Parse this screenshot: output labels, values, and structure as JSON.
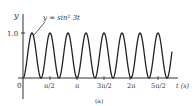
{
  "chart_data": {
    "type": "line",
    "title": "",
    "function_label": "y = sin² 3t",
    "xlabel": "t (s)",
    "ylabel": "y",
    "caption": "(a)",
    "x_ticks": [
      "0",
      "π/2",
      "π",
      "3π/2",
      "2π",
      "5π/2"
    ],
    "x_tick_values": [
      0,
      1.5708,
      3.1416,
      4.7124,
      6.2832,
      7.854
    ],
    "y_ticks": [
      "1.0"
    ],
    "y_tick_values": [
      1.0
    ],
    "xlim": [
      0,
      8.4
    ],
    "ylim": [
      0,
      1.0
    ],
    "series": [
      {
        "name": "y = sin² 3t",
        "formula": "sin(3t)^2",
        "period": 1.0472,
        "x": [
          0,
          0.2618,
          0.5236,
          0.7854,
          1.0472,
          1.309,
          1.5708,
          1.8326,
          2.0944,
          2.3562,
          2.618,
          2.8798,
          3.1416
        ],
        "values": [
          0,
          0.5,
          1,
          0.5,
          0,
          0.5,
          1,
          0.5,
          0,
          0.5,
          1,
          0.5,
          0
        ]
      }
    ],
    "grid": false,
    "legend": "none"
  },
  "labels": {
    "y_axis": "y",
    "x_axis": "t (s)",
    "origin": "0",
    "y_tick": "1.0",
    "tick_pi_2": "π/2",
    "tick_pi": "π",
    "tick_3pi_2": "3π/2",
    "tick_2pi": "2π",
    "tick_5pi_2": "5π/2",
    "annotation": "y = sin² 3t",
    "caption": "(a)"
  }
}
